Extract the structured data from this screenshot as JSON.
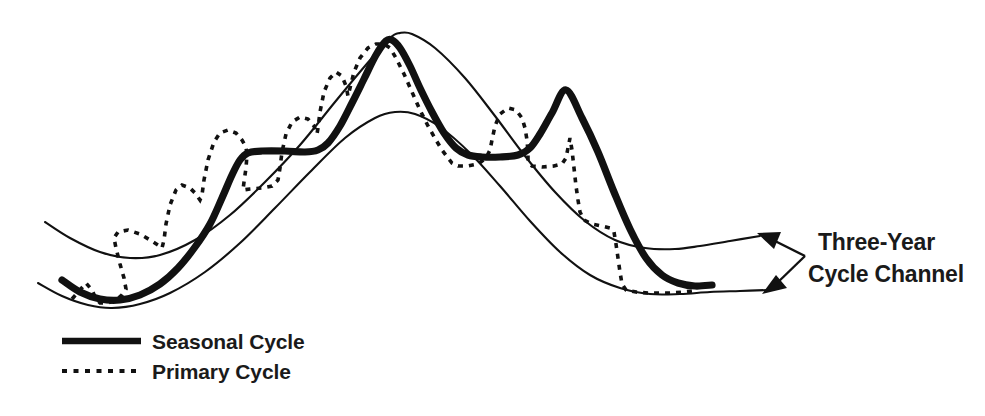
{
  "figure": {
    "title": "",
    "background_color": "#ffffff",
    "line_color": "#111111"
  },
  "annotation": {
    "name": "three-year-cycle-channel",
    "line1": "Three-Year",
    "line2": "Cycle Channel",
    "arrow_count": 2
  },
  "legend": {
    "items": [
      {
        "label": "Seasonal Cycle",
        "style": "solid",
        "weight": "thick"
      },
      {
        "label": "Primary Cycle",
        "style": "dotted",
        "weight": "medium"
      }
    ]
  },
  "chart_data": {
    "type": "line",
    "title": "",
    "subtitle": "",
    "xlabel": "",
    "ylabel": "",
    "grid": false,
    "legend_position": "bottom-left",
    "xlim": [
      0,
      985
    ],
    "ylim": [
      416,
      0
    ],
    "axis_visible": false,
    "tick_labels": [],
    "annotations": [
      {
        "text": "Three-Year Cycle Channel",
        "points_to": [
          "upper-channel-line",
          "lower-channel-line"
        ],
        "x": 818,
        "y": 243
      }
    ],
    "series": [
      {
        "name": "Upper Channel Line",
        "style": "thin-solid",
        "role": "channel-upper",
        "points": [
          [
            45,
            222
          ],
          [
            70,
            238
          ],
          [
            100,
            252
          ],
          [
            130,
            258
          ],
          [
            160,
            255
          ],
          [
            195,
            240
          ],
          [
            230,
            215
          ],
          [
            265,
            182
          ],
          [
            300,
            145
          ],
          [
            335,
            102
          ],
          [
            365,
            66
          ],
          [
            390,
            38
          ],
          [
            400,
            33
          ],
          [
            412,
            34
          ],
          [
            435,
            48
          ],
          [
            465,
            78
          ],
          [
            495,
            116
          ],
          [
            525,
            156
          ],
          [
            555,
            192
          ],
          [
            585,
            221
          ],
          [
            615,
            240
          ],
          [
            645,
            248
          ],
          [
            675,
            249
          ],
          [
            700,
            246
          ],
          [
            730,
            241
          ],
          [
            760,
            236
          ]
        ]
      },
      {
        "name": "Lower Channel Line",
        "style": "thin-solid",
        "role": "channel-lower",
        "points": [
          [
            38,
            283
          ],
          [
            62,
            296
          ],
          [
            88,
            305
          ],
          [
            112,
            308
          ],
          [
            140,
            304
          ],
          [
            170,
            293
          ],
          [
            205,
            272
          ],
          [
            240,
            243
          ],
          [
            275,
            208
          ],
          [
            310,
            172
          ],
          [
            345,
            138
          ],
          [
            375,
            118
          ],
          [
            395,
            112
          ],
          [
            415,
            114
          ],
          [
            440,
            127
          ],
          [
            470,
            153
          ],
          [
            500,
            186
          ],
          [
            530,
            221
          ],
          [
            560,
            252
          ],
          [
            590,
            275
          ],
          [
            620,
            288
          ],
          [
            650,
            294
          ],
          [
            680,
            294
          ],
          [
            710,
            292
          ],
          [
            740,
            291
          ],
          [
            768,
            290
          ]
        ]
      },
      {
        "name": "Seasonal Cycle",
        "style": "thick-solid",
        "role": "seasonal",
        "points": [
          [
            62,
            280
          ],
          [
            80,
            292
          ],
          [
            100,
            299
          ],
          [
            120,
            300
          ],
          [
            140,
            295
          ],
          [
            160,
            284
          ],
          [
            178,
            268
          ],
          [
            195,
            247
          ],
          [
            210,
            224
          ],
          [
            222,
            198
          ],
          [
            232,
            175
          ],
          [
            240,
            160
          ],
          [
            248,
            153
          ],
          [
            262,
            151
          ],
          [
            285,
            151
          ],
          [
            305,
            152
          ],
          [
            318,
            150
          ],
          [
            328,
            143
          ],
          [
            340,
            126
          ],
          [
            352,
            103
          ],
          [
            364,
            79
          ],
          [
            376,
            55
          ],
          [
            386,
            41
          ],
          [
            392,
            40
          ],
          [
            400,
            48
          ],
          [
            410,
            66
          ],
          [
            420,
            88
          ],
          [
            432,
            112
          ],
          [
            444,
            133
          ],
          [
            456,
            148
          ],
          [
            468,
            155
          ],
          [
            482,
            157
          ],
          [
            500,
            157
          ],
          [
            518,
            155
          ],
          [
            530,
            148
          ],
          [
            540,
            134
          ],
          [
            552,
            113
          ],
          [
            566,
            90
          ],
          [
            582,
            118
          ],
          [
            598,
            152
          ],
          [
            614,
            192
          ],
          [
            630,
            229
          ],
          [
            646,
            258
          ],
          [
            662,
            275
          ],
          [
            678,
            283
          ],
          [
            695,
            286
          ],
          [
            712,
            285
          ]
        ]
      },
      {
        "name": "Primary Cycle",
        "style": "dotted",
        "role": "primary",
        "points": [
          [
            72,
            299
          ],
          [
            80,
            290
          ],
          [
            86,
            283
          ],
          [
            92,
            290
          ],
          [
            96,
            299
          ],
          [
            100,
            303
          ],
          [
            108,
            303
          ],
          [
            116,
            300
          ],
          [
            122,
            295
          ],
          [
            126,
            289
          ],
          [
            124,
            278
          ],
          [
            120,
            264
          ],
          [
            116,
            248
          ],
          [
            114,
            238
          ],
          [
            118,
            232
          ],
          [
            128,
            230
          ],
          [
            140,
            234
          ],
          [
            150,
            240
          ],
          [
            158,
            245
          ],
          [
            162,
            248
          ],
          [
            164,
            240
          ],
          [
            166,
            224
          ],
          [
            170,
            205
          ],
          [
            176,
            190
          ],
          [
            182,
            185
          ],
          [
            190,
            188
          ],
          [
            196,
            194
          ],
          [
            200,
            200
          ],
          [
            202,
            195
          ],
          [
            204,
            180
          ],
          [
            208,
            160
          ],
          [
            214,
            142
          ],
          [
            220,
            133
          ],
          [
            228,
            130
          ],
          [
            236,
            133
          ],
          [
            242,
            140
          ],
          [
            246,
            147
          ],
          [
            247,
            155
          ],
          [
            246,
            168
          ],
          [
            244,
            182
          ],
          [
            243,
            190
          ],
          [
            250,
            189
          ],
          [
            262,
            188
          ],
          [
            272,
            186
          ],
          [
            278,
            180
          ],
          [
            280,
            168
          ],
          [
            282,
            152
          ],
          [
            286,
            134
          ],
          [
            292,
            122
          ],
          [
            300,
            117
          ],
          [
            308,
            119
          ],
          [
            314,
            126
          ],
          [
            317,
            134
          ],
          [
            318,
            128
          ],
          [
            320,
            112
          ],
          [
            324,
            92
          ],
          [
            330,
            78
          ],
          [
            336,
            72
          ],
          [
            342,
            76
          ],
          [
            346,
            86
          ],
          [
            348,
            96
          ],
          [
            350,
            88
          ],
          [
            354,
            72
          ],
          [
            360,
            58
          ],
          [
            368,
            48
          ],
          [
            376,
            44
          ],
          [
            384,
            44
          ],
          [
            390,
            48
          ],
          [
            396,
            58
          ],
          [
            404,
            74
          ],
          [
            412,
            92
          ],
          [
            420,
            110
          ],
          [
            428,
            126
          ],
          [
            436,
            140
          ],
          [
            442,
            150
          ],
          [
            448,
            158
          ],
          [
            452,
            163
          ],
          [
            458,
            166
          ],
          [
            468,
            166
          ],
          [
            478,
            164
          ],
          [
            486,
            158
          ],
          [
            490,
            150
          ],
          [
            492,
            140
          ],
          [
            495,
            126
          ],
          [
            500,
            114
          ],
          [
            508,
            108
          ],
          [
            516,
            110
          ],
          [
            522,
            118
          ],
          [
            525,
            128
          ],
          [
            527,
            140
          ],
          [
            528,
            152
          ],
          [
            528,
            162
          ],
          [
            532,
            166
          ],
          [
            542,
            167
          ],
          [
            554,
            166
          ],
          [
            562,
            164
          ],
          [
            566,
            158
          ],
          [
            568,
            148
          ],
          [
            570,
            138
          ],
          [
            572,
            150
          ],
          [
            574,
            168
          ],
          [
            576,
            186
          ],
          [
            578,
            200
          ],
          [
            580,
            212
          ],
          [
            584,
            220
          ],
          [
            592,
            224
          ],
          [
            602,
            226
          ],
          [
            610,
            228
          ],
          [
            614,
            232
          ],
          [
            616,
            244
          ],
          [
            618,
            258
          ],
          [
            620,
            272
          ],
          [
            622,
            284
          ],
          [
            626,
            290
          ],
          [
            636,
            292
          ],
          [
            648,
            293
          ],
          [
            660,
            293
          ],
          [
            672,
            293
          ],
          [
            684,
            292
          ],
          [
            692,
            291
          ]
        ]
      }
    ]
  }
}
